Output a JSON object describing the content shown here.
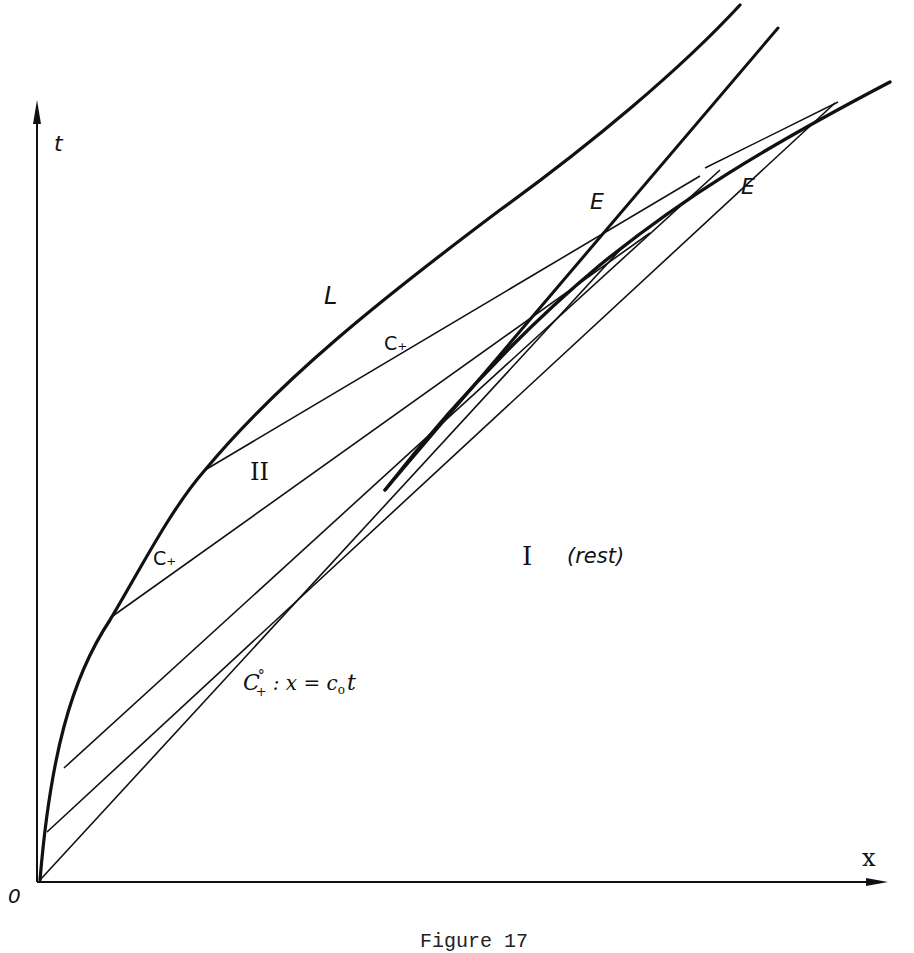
{
  "figure": {
    "caption": "Figure 17",
    "axes": {
      "x_label": "x",
      "y_label": "t",
      "origin_label": "0"
    },
    "labels": {
      "piston_path": "L",
      "c_plus_upper": "C₊",
      "c_plus_lower": "C₊",
      "region_two": "II",
      "region_one": "I",
      "region_one_note": "(rest)",
      "envelope_left": "E",
      "envelope_right": "E",
      "c_plus_zero_main": "C",
      "c_plus_zero_sub": "+",
      "c_plus_zero_sup": "°",
      "c_plus_zero_eq": ": x = c",
      "c_plus_zero_eq_sub": "o",
      "c_plus_zero_eq_end": "t"
    },
    "curves": [
      {
        "name": "L",
        "description": "accelerating piston path starting at origin, concave toward x-axis"
      },
      {
        "name": "C+ characteristics",
        "description": "straight lines emanating from piston path, fanning and converging toward an envelope"
      },
      {
        "name": "C+°",
        "description": "limiting characteristic x = c0 t from origin, bounding region I (rest)"
      },
      {
        "name": "E",
        "description": "envelope (shock formation) of C+ characteristics; two branches"
      }
    ]
  }
}
